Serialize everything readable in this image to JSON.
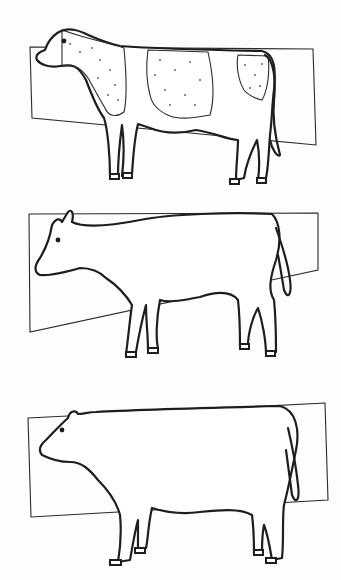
{
  "figure": {
    "type": "illustration",
    "panels": [
      {
        "id": 1,
        "subject": "cow",
        "pattern": "spotted (stippled patches on neck, mid-body and rump)",
        "rectangle_tilt": "slopes down to the right at bottom"
      },
      {
        "id": 2,
        "subject": "cow",
        "pattern": "plain outline with horns",
        "rectangle_tilt": "bottom edge rises to the right"
      },
      {
        "id": 3,
        "subject": "cow",
        "pattern": "plain outline, stocky build",
        "rectangle_tilt": "slight upward tilt to the right"
      }
    ],
    "colors": {
      "line": "#1e1e1e",
      "background": "#fdfdfd"
    }
  }
}
